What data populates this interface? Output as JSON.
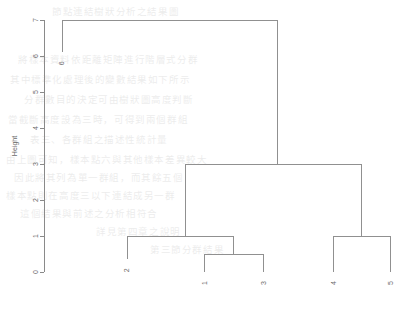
{
  "chart_data": {
    "type": "dendrogram",
    "title": "",
    "subtitle": "",
    "xlabel": "",
    "ylabel": "Height",
    "ylim": [
      0,
      7
    ],
    "grid": false,
    "legend": "none",
    "y_ticks": [
      {
        "value": 0,
        "label": "0"
      },
      {
        "value": 1,
        "label": "1"
      },
      {
        "value": 2,
        "label": "2"
      },
      {
        "value": 3,
        "label": "3"
      },
      {
        "value": 4,
        "label": "4"
      },
      {
        "value": 5,
        "label": "5"
      },
      {
        "value": 6,
        "label": "6"
      },
      {
        "value": 7,
        "label": "7"
      }
    ],
    "leaves": [
      {
        "label": "6",
        "x": 62,
        "drop_to_height": 6.1
      },
      {
        "label": "2",
        "x": 127,
        "drop_to_height": 0.35
      },
      {
        "label": "1",
        "x": 204,
        "drop_to_height": 0.0
      },
      {
        "label": "3",
        "x": 263,
        "drop_to_height": 0.0
      },
      {
        "label": "4",
        "x": 333,
        "drop_to_height": 0.0
      },
      {
        "label": "5",
        "x": 390,
        "drop_to_height": 0.0
      }
    ],
    "merges": [
      {
        "name": "merge-1-3",
        "height": 0.5,
        "left_x": 204,
        "right_x": 263,
        "left_height": 0.0,
        "right_height": 0.0
      },
      {
        "name": "merge-2-with-13",
        "height": 1.0,
        "left_x": 127,
        "right_x": 233,
        "left_height": 0.35,
        "right_height": 0.5
      },
      {
        "name": "merge-4-5",
        "height": 1.0,
        "left_x": 333,
        "right_x": 390,
        "left_height": 0.0,
        "right_height": 0.0
      },
      {
        "name": "merge-left-right",
        "height": 3.0,
        "left_x": 185,
        "right_x": 361,
        "left_height": 1.0,
        "right_height": 1.0
      },
      {
        "name": "merge-root",
        "height": 7.0,
        "left_x": 62,
        "right_x": 277,
        "left_height": 6.1,
        "right_height": 3.0
      }
    ],
    "axis_geometry": {
      "y_pixel_at_zero": 272,
      "y_pixel_at_max": 20,
      "axis_x": 44,
      "tick_length": 4
    }
  },
  "background_text": {
    "note": "faint bleed-through from reverse side of scanned page",
    "lines": [
      {
        "x": 52,
        "y": 4,
        "text": "節點連結樹狀分析之結果圖"
      },
      {
        "x": 18,
        "y": 52,
        "text": "將樣本資料依距離矩陣進行階層式分群"
      },
      {
        "x": 10,
        "y": 72,
        "text": "其中標準化處理後的變數結果如下所示"
      },
      {
        "x": 24,
        "y": 92,
        "text": "分群數目的決定可由樹狀圖高度判斷"
      },
      {
        "x": 8,
        "y": 112,
        "text": "當截斷高度設為三時，可得到兩個群組"
      },
      {
        "x": 30,
        "y": 132,
        "text": "表三、各群組之描述性統計量"
      },
      {
        "x": 6,
        "y": 152,
        "text": "由上圖可知，樣本點六與其他樣本差異較大"
      },
      {
        "x": 14,
        "y": 170,
        "text": "因此將其列為單一群組，而其餘五個"
      },
      {
        "x": 6,
        "y": 188,
        "text": "樣本點則在高度三以下連結成另一群"
      },
      {
        "x": 20,
        "y": 206,
        "text": "這個結果與前述之分析相符合"
      },
      {
        "x": 96,
        "y": 224,
        "text": "詳見第四章之說明"
      },
      {
        "x": 150,
        "y": 242,
        "text": "第三節分群結果"
      }
    ]
  }
}
